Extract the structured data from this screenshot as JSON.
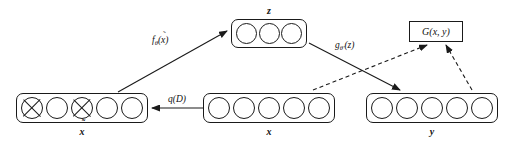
{
  "diagram": {
    "type": "neural-network-architecture",
    "background_color": "#ffffff",
    "stroke_color": "#1a1a1a"
  },
  "layers": [
    {
      "id": "z",
      "label": "z",
      "label_text": "z",
      "units": 3,
      "corrupted_indices": [],
      "x": 231,
      "y": 19,
      "width": 76,
      "height": 29,
      "unit_size": 21,
      "label_position": "above"
    },
    {
      "id": "x-tilde",
      "label": "x̃",
      "label_text": "x",
      "has_tilde": true,
      "units": 5,
      "corrupted_indices": [
        0,
        2
      ],
      "x": 16,
      "y": 93,
      "width": 132,
      "height": 30,
      "unit_size": 22,
      "label_position": "below"
    },
    {
      "id": "x",
      "label": "x",
      "label_text": "x",
      "units": 5,
      "corrupted_indices": [],
      "x": 203,
      "y": 93,
      "width": 132,
      "height": 30,
      "unit_size": 22,
      "label_position": "below"
    },
    {
      "id": "y",
      "label": "y",
      "label_text": "y",
      "units": 5,
      "corrupted_indices": [],
      "x": 366,
      "y": 93,
      "width": 132,
      "height": 30,
      "unit_size": 22,
      "label_position": "below"
    }
  ],
  "discriminator": {
    "id": "G",
    "label": "G(x, y)",
    "x": 409,
    "y": 21,
    "width": 54,
    "height": 21
  },
  "edges": [
    {
      "id": "corrupt",
      "from": "x",
      "to": "x-tilde",
      "label": "q(D)",
      "style": "solid",
      "label_x": 168,
      "label_y": 94,
      "x1": 203,
      "y1": 108,
      "x2": 152,
      "y2": 108
    },
    {
      "id": "encode",
      "from": "x-tilde",
      "to": "z",
      "label": "fθ(x̃)",
      "label_main": "f",
      "label_sub": "θ",
      "label_arg": "(x̃)",
      "style": "solid",
      "label_x": 152,
      "label_y": 35,
      "x1": 118,
      "y1": 92,
      "x2": 227,
      "y2": 31
    },
    {
      "id": "decode",
      "from": "z",
      "to": "y",
      "label": "gθ'(z)",
      "label_main": "g",
      "label_sub": "θ'",
      "label_arg": "(z)",
      "style": "solid",
      "label_x": 335,
      "label_y": 40,
      "x1": 309,
      "y1": 43,
      "x2": 400,
      "y2": 90
    },
    {
      "id": "disc-real",
      "from": "x",
      "to": "G",
      "label": "",
      "style": "dashed",
      "x1": 313,
      "y1": 90,
      "x2": 427,
      "y2": 45
    },
    {
      "id": "disc-fake",
      "from": "y",
      "to": "G",
      "label": "",
      "style": "dashed",
      "x1": 472,
      "y1": 90,
      "x2": 446,
      "y2": 45
    }
  ]
}
